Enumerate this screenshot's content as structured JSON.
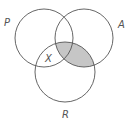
{
  "diagram": {
    "type": "venn",
    "sets": [
      {
        "id": "P",
        "label": "P",
        "cx": 44,
        "cy": 38,
        "r": 29
      },
      {
        "id": "A",
        "label": "A",
        "cx": 84,
        "cy": 38,
        "r": 29
      },
      {
        "id": "R",
        "label": "R",
        "cx": 65,
        "cy": 72,
        "r": 30
      }
    ],
    "region_label": "X",
    "shaded_region": "A ∩ R",
    "colors": {
      "stroke": "#555555",
      "shade": "#c6c6c6",
      "background": "#ffffff"
    }
  }
}
